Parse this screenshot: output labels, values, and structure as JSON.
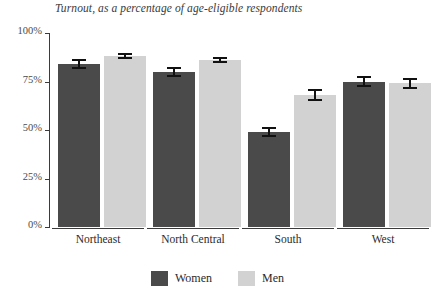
{
  "chart_data": {
    "type": "bar",
    "title": "Turnout, as a percentage of age-eligible respondents",
    "xlabel": "",
    "ylabel": "",
    "ylim": [
      0,
      100
    ],
    "grid": false,
    "legend_position": "bottom-center",
    "categories": [
      "Northeast",
      "North Central",
      "South",
      "West"
    ],
    "series": [
      {
        "name": "Women",
        "color": "#4a4a4a",
        "values": [
          84,
          80,
          49,
          75
        ],
        "errors": [
          2.5,
          2.5,
          2.5,
          3.0
        ]
      },
      {
        "name": "Men",
        "color": "#d2d2d2",
        "values": [
          88,
          86,
          68,
          74
        ],
        "errors": [
          1.5,
          1.5,
          3.0,
          3.0
        ]
      }
    ],
    "y_ticks": [
      {
        "value": 0,
        "label": "0%"
      },
      {
        "value": 25,
        "label": "25%"
      },
      {
        "value": 50,
        "label": "50%"
      },
      {
        "value": 75,
        "label": "75%"
      },
      {
        "value": 100,
        "label": "100%"
      }
    ]
  }
}
